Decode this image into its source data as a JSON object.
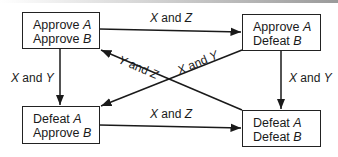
{
  "diagram": {
    "type": "state-transition",
    "states": [
      {
        "id": "tl",
        "line1": "Approve",
        "var1": "A",
        "line2": "Approve",
        "var2": "B"
      },
      {
        "id": "tr",
        "line1": "Approve",
        "var1": "A",
        "line2": "Defeat",
        "var2": "B"
      },
      {
        "id": "bl",
        "line1": "Defeat",
        "var1": "A",
        "line2": "Approve",
        "var2": "B"
      },
      {
        "id": "br",
        "line1": "Defeat",
        "var1": "A",
        "line2": "Defeat",
        "var2": "B"
      }
    ],
    "edges": [
      {
        "from": "tl",
        "to": "tr",
        "v1": "X",
        "conj": " and ",
        "v2": "Z"
      },
      {
        "from": "bl",
        "to": "br",
        "v1": "X",
        "conj": " and ",
        "v2": "Z"
      },
      {
        "from": "tl",
        "to": "bl",
        "v1": "X",
        "conj": " and ",
        "v2": "Y"
      },
      {
        "from": "tr",
        "to": "br",
        "v1": "X",
        "conj": " and ",
        "v2": "Y"
      },
      {
        "from": "br",
        "to": "tl",
        "v1": "Y",
        "conj": " and ",
        "v2": "Z"
      },
      {
        "from": "tr",
        "to": "bl",
        "v1": "X",
        "conj": " and ",
        "v2": "Y"
      }
    ]
  },
  "colors": {
    "line": "#1a1a1a",
    "background": "#ffffff"
  }
}
